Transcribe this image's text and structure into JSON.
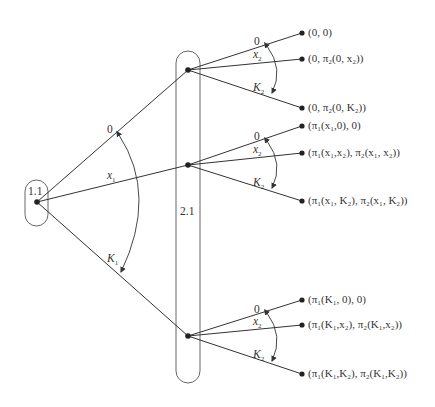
{
  "diagram": {
    "type": "extensive-form game tree",
    "colors": {
      "line": "#333333",
      "node": "#222222",
      "background": "#ffffff"
    },
    "root": {
      "info_set_label": "1.1",
      "x": 37,
      "y": 202
    },
    "player2_info_set": {
      "label": "2.1"
    },
    "player1_actions": [
      {
        "label": "0",
        "sub": ""
      },
      {
        "label": "x",
        "sub": "1"
      },
      {
        "label": "K",
        "sub": "1"
      }
    ],
    "player2_nodes": [
      {
        "x": 188,
        "y": 70
      },
      {
        "x": 188,
        "y": 165
      },
      {
        "x": 188,
        "y": 336
      }
    ],
    "player2_actions": [
      {
        "label": "0",
        "sub": ""
      },
      {
        "label": "x",
        "sub": "2"
      },
      {
        "label": "K",
        "sub": "2"
      }
    ],
    "payoffs": [
      "(0, 0)",
      "(0, π₂(0, x₂))",
      "(0, π₂(0, K₂))",
      "(π₁(x₁,0), 0)",
      "(π₁(x₁,x₂), π₂(x₁, x₂))",
      "(π₁(x₁, K₂), π₂(x₁, K₂))",
      "(π₁(K₁, 0), 0)",
      "(π₁(K₁,x₂), π₂(K₁,x₂))",
      "(π₁(K₁,K₂), π₂(K₁,K₂))"
    ]
  }
}
